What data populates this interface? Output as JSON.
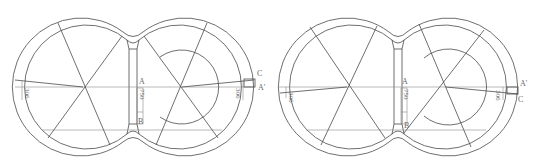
{
  "figures": [
    {
      "id": "left",
      "labels": {
        "A": "A",
        "B": "B",
        "C": "C",
        "A_prime": "A'"
      },
      "dimensions": {
        "left_radius_label": "306",
        "center_label": "750",
        "right_radius_label": "306"
      },
      "variant": "C above A'"
    },
    {
      "id": "right",
      "labels": {
        "A": "A",
        "B": "B",
        "C": "C",
        "A_prime": "A'"
      },
      "dimensions": {
        "left_radius_label": "306",
        "center_label": "750",
        "right_radius_label": "306"
      },
      "variant": "A' above C"
    }
  ],
  "colors": {
    "line": "#4a4a4a",
    "text": "#6a6a6a",
    "background": "#ffffff"
  }
}
